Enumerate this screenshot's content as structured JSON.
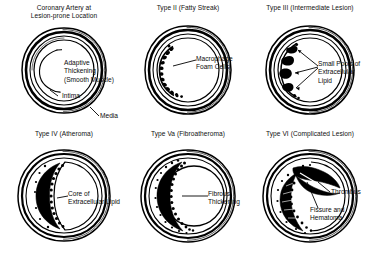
{
  "figure": {
    "background_color": "#ffffff",
    "ink_color": "#000000",
    "panel_count": 6
  },
  "panels": [
    {
      "id": "coronary-artery-lesion-prone",
      "title": "Coronary Artery at\nLesion-prone Location",
      "labels": [
        {
          "id": "adaptive-thickening",
          "text": "Adaptive\nThickening\n(Smooth Muscle)"
        },
        {
          "id": "intima",
          "text": "Intima"
        },
        {
          "id": "media",
          "text": "Media"
        }
      ]
    },
    {
      "id": "type-ii-fatty-streak",
      "title": "Type II (Fatty Streak)",
      "labels": [
        {
          "id": "macrophage-foam-cells",
          "text": "Macrophage\nFoam Cells"
        }
      ]
    },
    {
      "id": "type-iii-intermediate-lesion",
      "title": "Type III (Intermediate Lesion)",
      "labels": [
        {
          "id": "small-pools-extracellular-lipid",
          "text": "Small Pools of\nExtracellular\nLipid"
        }
      ]
    },
    {
      "id": "type-iv-atheroma",
      "title": "Type IV (Atheroma)",
      "labels": [
        {
          "id": "core-of-extracellular-lipid",
          "text": "Core of\nExtracellular Lipid"
        }
      ]
    },
    {
      "id": "type-va-fibroatheroma",
      "title": "Type Va (Fibroatheroma)",
      "labels": [
        {
          "id": "fibrous-thickening",
          "text": "Fibrous\nThickening"
        }
      ]
    },
    {
      "id": "type-vi-complicated-lesion",
      "title": "Type VI (Complicated Lesion)",
      "labels": [
        {
          "id": "thrombus",
          "text": "Thrombus"
        },
        {
          "id": "fissure-and-hematoma",
          "text": "Fissure and\nHematoma"
        }
      ]
    }
  ]
}
